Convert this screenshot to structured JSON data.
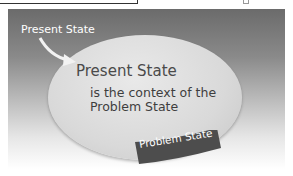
{
  "diagram": {
    "outer_label": "Present State",
    "ellipse_title": "Present State",
    "ellipse_body_line1": "is the context of the",
    "ellipse_body_line2": "Problem State",
    "ribbon_label": "Problem State"
  },
  "colors": {
    "panel_top": "#6b6b6b",
    "ellipse": "#dcdcdc",
    "ribbon": "#4d4d4d",
    "text_dark": "#4a4a4a"
  }
}
